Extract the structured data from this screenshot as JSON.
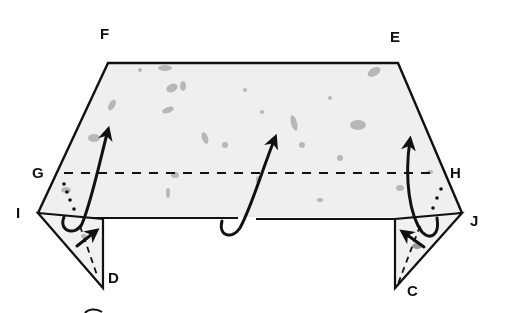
{
  "diagram": {
    "type": "origami-fold-diagram",
    "colors": {
      "paper_fill": "#eeeeee",
      "speckle": "#9a9a9a",
      "line": "#111111",
      "background": "#ffffff"
    },
    "points": {
      "F": {
        "label": "F",
        "x": 118,
        "y": 40
      },
      "E": {
        "label": "E",
        "x": 397,
        "y": 41
      },
      "G": {
        "label": "G",
        "x": 40,
        "y": 176
      },
      "H": {
        "label": "H",
        "x": 458,
        "y": 176
      },
      "I": {
        "label": "I",
        "x": 14,
        "y": 217
      },
      "J": {
        "label": "J",
        "x": 471,
        "y": 225
      },
      "D": {
        "label": "D",
        "x": 114,
        "y": 281
      },
      "C": {
        "label": "C",
        "x": 408,
        "y": 296
      }
    },
    "fold_lines": [
      {
        "name": "valley-fold-G-H",
        "style": "dashed"
      }
    ],
    "arrows": [
      {
        "name": "left-fold-up-arrow",
        "kind": "curved"
      },
      {
        "name": "center-fold-up-arrow",
        "kind": "curved"
      },
      {
        "name": "right-fold-up-arrow",
        "kind": "curved"
      },
      {
        "name": "left-flap-tuck-arrow",
        "kind": "straight"
      },
      {
        "name": "right-flap-tuck-arrow",
        "kind": "straight"
      }
    ]
  }
}
